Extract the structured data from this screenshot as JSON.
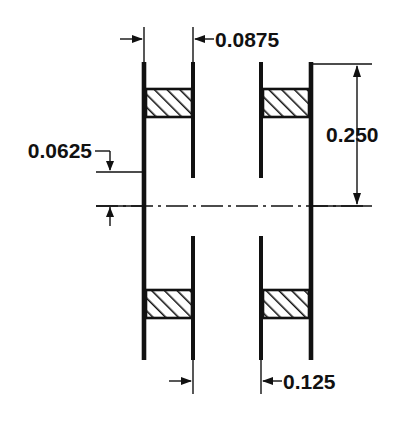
{
  "drawing": {
    "title": "Cross-section dimension drawing",
    "ink_color": "#111111",
    "background_color": "#ffffff",
    "dimensions": [
      {
        "id": "top_width",
        "label": "0.0875",
        "orientation": "horizontal",
        "position": "top"
      },
      {
        "id": "overall_height",
        "label": "0.250",
        "orientation": "vertical",
        "position": "right"
      },
      {
        "id": "left_offset",
        "label": "0.0625",
        "orientation": "vertical",
        "position": "left"
      },
      {
        "id": "bottom_width",
        "label": "0.125",
        "orientation": "horizontal",
        "position": "bottom"
      }
    ],
    "labels": {
      "top": "0.0875",
      "right": "0.250",
      "left": "0.0625",
      "bottom": "0.125"
    },
    "features": {
      "section_count": 4,
      "hatch_angle_deg": 45,
      "centerline_style": "dash-dot",
      "view": "section"
    }
  }
}
